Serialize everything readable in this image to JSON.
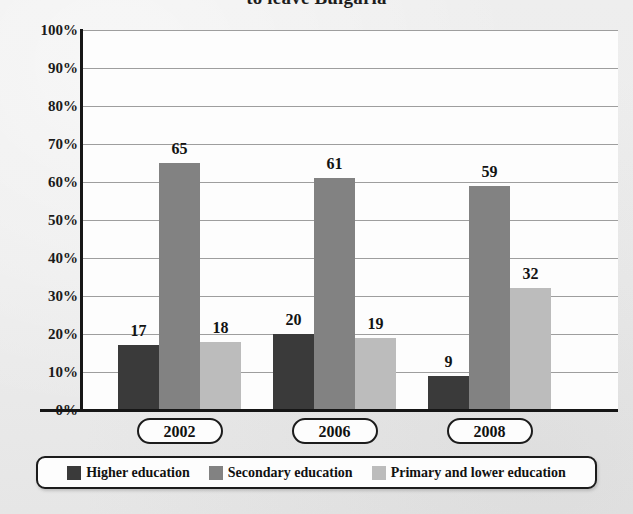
{
  "title": "to leave Bulgaria",
  "colors": {
    "higher": "#3a3a3a",
    "secondary": "#828282",
    "primary": "#bcbcbc",
    "axis": "#161616",
    "grid": "#8d8d8d",
    "plot_background": "#fdfdfd",
    "page_background": "#ececec"
  },
  "y_axis": {
    "ticks": [
      "100%",
      "90%",
      "80%",
      "70%",
      "60%",
      "50%",
      "40%",
      "30%",
      "20%",
      "10%",
      "0%"
    ]
  },
  "legend": {
    "items": [
      {
        "label": "Higher education",
        "color": "#3a3a3a"
      },
      {
        "label": "Secondary education",
        "color": "#828282"
      },
      {
        "label": "Primary and lower education",
        "color": "#bcbcbc"
      }
    ]
  },
  "chart_data": {
    "type": "bar",
    "title": "to leave Bulgaria",
    "xlabel": "",
    "ylabel": "",
    "ylim": [
      0,
      100
    ],
    "ytick_step": 10,
    "grid": true,
    "legend_position": "bottom",
    "value_labels": true,
    "categories": [
      "2002",
      "2006",
      "2008"
    ],
    "series": [
      {
        "name": "Higher education",
        "color": "#3a3a3a",
        "values": [
          17,
          20,
          9
        ]
      },
      {
        "name": "Secondary education",
        "color": "#828282",
        "values": [
          65,
          61,
          59
        ]
      },
      {
        "name": "Primary and lower education",
        "color": "#bcbcbc",
        "values": [
          18,
          19,
          32
        ]
      }
    ]
  }
}
